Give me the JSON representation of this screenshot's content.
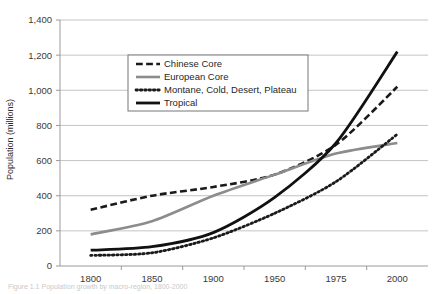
{
  "figure": {
    "caption": "Figure 1.1 Population growth by macro-region, 1800-2000"
  },
  "chart_data": {
    "type": "line",
    "title": "",
    "xlabel": "",
    "ylabel": "Population (millions)",
    "categories": [
      "1800",
      "1850",
      "1900",
      "1950",
      "1975",
      "2000"
    ],
    "ylim": [
      0,
      1400
    ],
    "yticks": [
      0,
      200,
      400,
      600,
      800,
      1000,
      1200,
      1400
    ],
    "ytick_labels": [
      "0",
      "200",
      "400",
      "600",
      "800",
      "1,000",
      "1,200",
      "1,400"
    ],
    "grid": "horizontal",
    "legend_position": "upper-center",
    "series": [
      {
        "name": "Chinese Core",
        "style": "dashed",
        "color": "#1a1a1a",
        "width": 2.6,
        "values": [
          320,
          400,
          450,
          520,
          690,
          1020
        ]
      },
      {
        "name": "European Core",
        "style": "solid",
        "color": "#8c8c8c",
        "width": 2.6,
        "values": [
          180,
          255,
          400,
          520,
          640,
          700
        ]
      },
      {
        "name": "Montane, Cold, Desert, Plateau",
        "style": "dotted",
        "color": "#1a1a1a",
        "width": 2.8,
        "values": [
          60,
          75,
          160,
          300,
          480,
          750
        ]
      },
      {
        "name": "Tropical",
        "style": "solid",
        "color": "#111111",
        "width": 2.8,
        "values": [
          90,
          110,
          190,
          390,
          700,
          1220
        ]
      }
    ]
  },
  "legend": {
    "items": [
      {
        "label": "Chinese Core"
      },
      {
        "label": "European Core"
      },
      {
        "label": "Montane, Cold, Desert, Plateau"
      },
      {
        "label": "Tropical"
      }
    ]
  }
}
